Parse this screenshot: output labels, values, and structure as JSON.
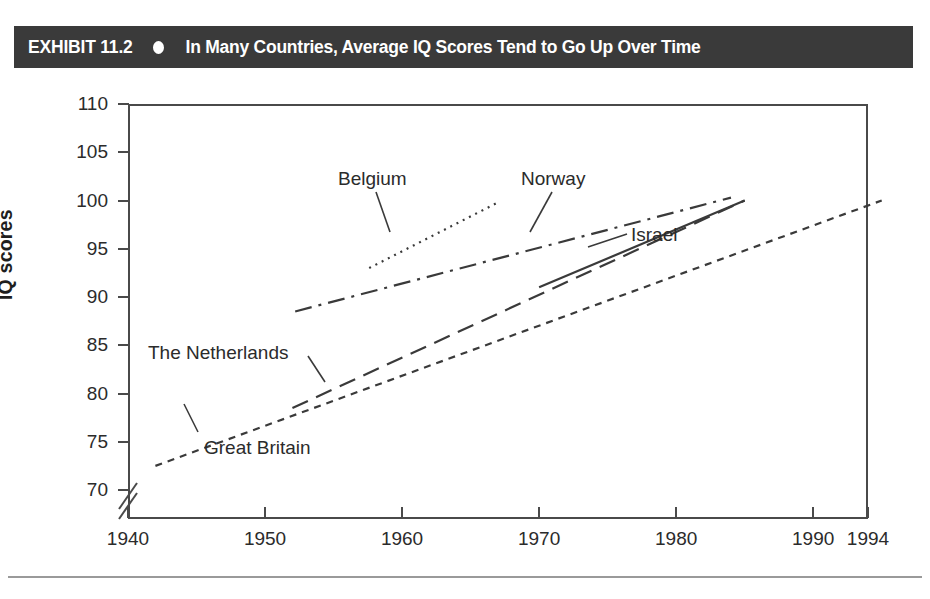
{
  "header": {
    "exhibit_label": "EXHIBIT 11.2",
    "bullet_icon": "filled-circle-icon",
    "title": "In Many Countries, Average IQ Scores Tend to Go Up Over Time",
    "bar_color": "#3a3a3a",
    "text_color": "#ffffff"
  },
  "chart_data": {
    "type": "line",
    "title": "In Many Countries, Average IQ Scores Tend to Go Up Over Time",
    "xlabel": "",
    "ylabel": "IQ scores",
    "xlim": [
      1940,
      1994
    ],
    "ylim": [
      70,
      110
    ],
    "ytick_labels": [
      "110",
      "105",
      "100",
      "95",
      "90",
      "85",
      "80",
      "75",
      "70"
    ],
    "yticks": [
      110,
      105,
      100,
      95,
      90,
      85,
      80,
      75,
      70
    ],
    "xtick_labels": [
      "1940",
      "1950",
      "1960",
      "1970",
      "1980",
      "1990",
      "1994"
    ],
    "xticks": [
      1940,
      1950,
      1960,
      1970,
      1980,
      1990,
      1994
    ],
    "grid": false,
    "legend": "inline-annotations",
    "y_axis_break": true,
    "series": [
      {
        "name": "Great Britain",
        "style": "short-dash",
        "x": [
          1942,
          1995
        ],
        "values": [
          72.5,
          100.0
        ],
        "label_position": "below-line-left"
      },
      {
        "name": "The Netherlands",
        "style": "long-dash",
        "x": [
          1952,
          1985
        ],
        "values": [
          78.5,
          100.0
        ],
        "label_position": "above-line-left"
      },
      {
        "name": "Norway",
        "style": "dash-dot",
        "x": [
          1952.2,
          1984
        ],
        "values": [
          88.5,
          100.3
        ],
        "label_position": "above-line"
      },
      {
        "name": "Belgium",
        "style": "dotted",
        "x": [
          1957.6,
          1967
        ],
        "values": [
          93.0,
          99.8
        ],
        "label_position": "above-line"
      },
      {
        "name": "Israel",
        "style": "solid",
        "x": [
          1970,
          1985
        ],
        "values": [
          91.0,
          100.0
        ],
        "label_position": "right-of-line"
      }
    ],
    "annotations": [
      {
        "text": "Belgium",
        "x": 1957,
        "y": 101.5
      },
      {
        "text": "Norway",
        "x": 1974,
        "y": 101.5
      },
      {
        "text": "Israel",
        "x": 1983,
        "y": 96.0
      },
      {
        "text": "The Netherlands",
        "x": 1942,
        "y": 84.0
      },
      {
        "text": "Great Britain",
        "x": 1947,
        "y": 72.5
      }
    ]
  },
  "axis": {
    "y_title": "IQ scores",
    "break_icon": "axis-break-icon"
  }
}
